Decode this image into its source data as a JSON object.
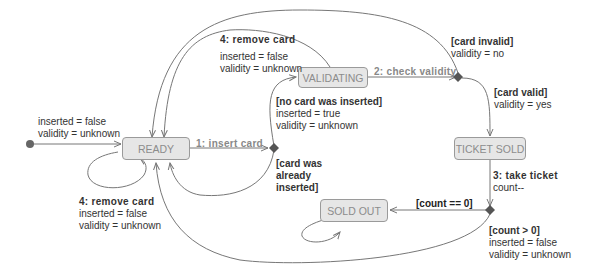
{
  "diagram": {
    "type": "state-machine",
    "initial": {
      "actions": [
        "inserted = false",
        "validity = unknown"
      ]
    },
    "states": {
      "ready": "READY",
      "validating": "VALIDATING",
      "ticket_sold": "TICKET SOLD",
      "sold_out": "SOLD OUT"
    },
    "transitions": {
      "insert_card": {
        "event": "1: insert card"
      },
      "check_validity": {
        "event": "2: check validity"
      },
      "take_ticket": {
        "event": "3: take ticket",
        "action": "count--"
      },
      "remove_card_top": {
        "event": "4: remove card",
        "actions": [
          "inserted = false",
          "validity = unknown"
        ]
      },
      "remove_card_self": {
        "event": "4: remove card",
        "actions": [
          "inserted = false",
          "validity = unknown"
        ]
      },
      "no_card_inserted": {
        "guard": "[no card was inserted]",
        "actions": [
          "inserted = true",
          "validity = unknown"
        ]
      },
      "card_already_inserted": {
        "guard_lines": [
          "[card was",
          "already",
          "inserted]"
        ]
      },
      "card_invalid": {
        "guard": "[card invalid]",
        "action": "validity = no"
      },
      "card_valid": {
        "guard": "[card valid]",
        "action": "validity = yes"
      },
      "count_zero": {
        "guard": "[count == 0]"
      },
      "count_positive": {
        "guard": "[count > 0]",
        "actions": [
          "inserted = false",
          "validity = unknown"
        ]
      }
    },
    "colors": {
      "state_fill": "#e6e6e6",
      "state_border": "#9a9a9a",
      "line": "#777777",
      "event_text": "#888888",
      "node": "#555555"
    }
  }
}
